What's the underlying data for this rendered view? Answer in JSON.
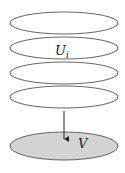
{
  "diagram": {
    "stack_ellipses": [
      {
        "cx": 64,
        "cy": 23,
        "rx": 54,
        "ry": 11
      },
      {
        "cx": 64,
        "cy": 48,
        "rx": 54,
        "ry": 11
      },
      {
        "cx": 64,
        "cy": 73,
        "rx": 54,
        "ry": 11
      },
      {
        "cx": 64,
        "cy": 97,
        "rx": 54,
        "ry": 11
      }
    ],
    "base_ellipse": {
      "cx": 64,
      "cy": 146,
      "rx": 54,
      "ry": 14,
      "fill": "#d4d4d4"
    },
    "stroke_color": "#555555",
    "labels": {
      "upper_main": "U",
      "upper_sub": "i",
      "lower": "V"
    },
    "arrow": {
      "x": 64,
      "y1": 111,
      "y2": 140
    }
  }
}
